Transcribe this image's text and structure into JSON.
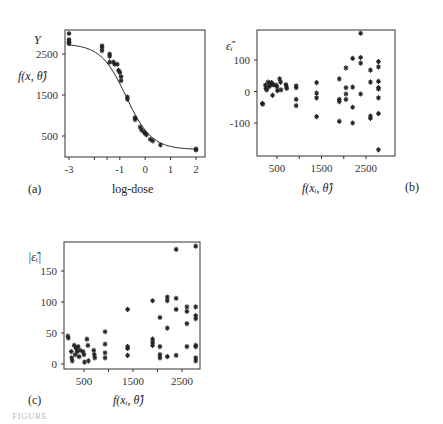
{
  "chart_data": [
    {
      "panel": "(a)",
      "type": "scatter",
      "title": "",
      "xlabel": "log-dose",
      "ylabel": "Y / f(x, θ̂)",
      "xticks": [
        -3,
        -1,
        0,
        1,
        2
      ],
      "yticks": [
        500,
        1500,
        2500
      ],
      "xlim": [
        -3.1,
        2.2
      ],
      "ylim": [
        0,
        3100
      ],
      "grid": false,
      "fitted_curve": {
        "form": "logistic",
        "top": 2750,
        "bottom": 170,
        "midpoint": -0.75,
        "slope": 2.0
      },
      "points": [
        {
          "x": -3,
          "y": 3000
        },
        {
          "x": -3,
          "y": 2850
        },
        {
          "x": -3,
          "y": 2800
        },
        {
          "x": -3,
          "y": 2780
        },
        {
          "x": -3,
          "y": 2750
        },
        {
          "x": -1.7,
          "y": 2700
        },
        {
          "x": -1.7,
          "y": 2650
        },
        {
          "x": -1.7,
          "y": 2580
        },
        {
          "x": -1.4,
          "y": 2500
        },
        {
          "x": -1.4,
          "y": 2450
        },
        {
          "x": -1.4,
          "y": 2300
        },
        {
          "x": -1.25,
          "y": 2300
        },
        {
          "x": -1.2,
          "y": 2250
        },
        {
          "x": -1.1,
          "y": 2250
        },
        {
          "x": -1.05,
          "y": 2100
        },
        {
          "x": -1.0,
          "y": 2050
        },
        {
          "x": -0.95,
          "y": 1950
        },
        {
          "x": -0.95,
          "y": 1850
        },
        {
          "x": -0.7,
          "y": 1450
        },
        {
          "x": -0.7,
          "y": 1400
        },
        {
          "x": -0.4,
          "y": 950
        },
        {
          "x": -0.4,
          "y": 900
        },
        {
          "x": -0.2,
          "y": 720
        },
        {
          "x": -0.15,
          "y": 650
        },
        {
          "x": -0.05,
          "y": 600
        },
        {
          "x": 0,
          "y": 560
        },
        {
          "x": 0.05,
          "y": 530
        },
        {
          "x": 0.2,
          "y": 420
        },
        {
          "x": 0.3,
          "y": 380
        },
        {
          "x": 0.6,
          "y": 280
        },
        {
          "x": 2,
          "y": 180
        },
        {
          "x": 2,
          "y": 160
        }
      ]
    },
    {
      "panel": "(b)",
      "type": "scatter",
      "title": "",
      "xlabel": "f(x_i, θ̂)",
      "ylabel": "ε̂_i",
      "xticks": [
        500,
        1500,
        2500
      ],
      "yticks": [
        -100,
        0,
        100
      ],
      "xlim": [
        60,
        2900
      ],
      "ylim": [
        -200,
        200
      ],
      "grid": false,
      "points": [
        {
          "x": 170,
          "y": -38
        },
        {
          "x": 180,
          "y": -40
        },
        {
          "x": 240,
          "y": 20
        },
        {
          "x": 250,
          "y": 10
        },
        {
          "x": 270,
          "y": 5
        },
        {
          "x": 300,
          "y": 30
        },
        {
          "x": 320,
          "y": 15
        },
        {
          "x": 340,
          "y": 25
        },
        {
          "x": 360,
          "y": 20
        },
        {
          "x": 380,
          "y": 28
        },
        {
          "x": 400,
          "y": -12
        },
        {
          "x": 420,
          "y": 22
        },
        {
          "x": 480,
          "y": 20
        },
        {
          "x": 500,
          "y": 15
        },
        {
          "x": 510,
          "y": 3
        },
        {
          "x": 560,
          "y": 40
        },
        {
          "x": 580,
          "y": 30
        },
        {
          "x": 590,
          "y": 5
        },
        {
          "x": 700,
          "y": 22
        },
        {
          "x": 710,
          "y": 15
        },
        {
          "x": 720,
          "y": 10
        },
        {
          "x": 930,
          "y": 18
        },
        {
          "x": 930,
          "y": 12
        },
        {
          "x": 930,
          "y": -25
        },
        {
          "x": 930,
          "y": -45
        },
        {
          "x": 1390,
          "y": 28
        },
        {
          "x": 1390,
          "y": -5
        },
        {
          "x": 1390,
          "y": -20
        },
        {
          "x": 1390,
          "y": -80
        },
        {
          "x": 1900,
          "y": 40
        },
        {
          "x": 1900,
          "y": -25
        },
        {
          "x": 1900,
          "y": -32
        },
        {
          "x": 1900,
          "y": -95
        },
        {
          "x": 2050,
          "y": 75
        },
        {
          "x": 2050,
          "y": 12
        },
        {
          "x": 2050,
          "y": -8
        },
        {
          "x": 2050,
          "y": -25
        },
        {
          "x": 2200,
          "y": 105
        },
        {
          "x": 2200,
          "y": 14
        },
        {
          "x": 2200,
          "y": -50
        },
        {
          "x": 2200,
          "y": -100
        },
        {
          "x": 2380,
          "y": 185
        },
        {
          "x": 2380,
          "y": 108
        },
        {
          "x": 2380,
          "y": 90
        },
        {
          "x": 2380,
          "y": -8
        },
        {
          "x": 2600,
          "y": 68
        },
        {
          "x": 2600,
          "y": 30
        },
        {
          "x": 2600,
          "y": -78
        },
        {
          "x": 2600,
          "y": -85
        },
        {
          "x": 2780,
          "y": 95
        },
        {
          "x": 2780,
          "y": 78
        },
        {
          "x": 2780,
          "y": 32
        },
        {
          "x": 2780,
          "y": 12
        },
        {
          "x": 2780,
          "y": 8
        },
        {
          "x": 2780,
          "y": -20
        },
        {
          "x": 2780,
          "y": -70
        },
        {
          "x": 2780,
          "y": -185
        }
      ]
    },
    {
      "panel": "(c)",
      "type": "scatter",
      "title": "",
      "xlabel": "f(x_i, θ̂)",
      "ylabel": "|ε̂_i|",
      "xticks": [
        500,
        1500,
        2500
      ],
      "yticks": [
        0,
        50,
        100,
        150
      ],
      "xlim": [
        60,
        2900
      ],
      "ylim": [
        -5,
        195
      ],
      "grid": false,
      "points": [
        {
          "x": 170,
          "y": 45
        },
        {
          "x": 180,
          "y": 42
        },
        {
          "x": 240,
          "y": 20
        },
        {
          "x": 250,
          "y": 10
        },
        {
          "x": 260,
          "y": 5
        },
        {
          "x": 300,
          "y": 30
        },
        {
          "x": 320,
          "y": 15
        },
        {
          "x": 340,
          "y": 25
        },
        {
          "x": 360,
          "y": 20
        },
        {
          "x": 380,
          "y": 28
        },
        {
          "x": 400,
          "y": 12
        },
        {
          "x": 420,
          "y": 22
        },
        {
          "x": 480,
          "y": 20
        },
        {
          "x": 500,
          "y": 15
        },
        {
          "x": 510,
          "y": 3
        },
        {
          "x": 560,
          "y": 40
        },
        {
          "x": 580,
          "y": 30
        },
        {
          "x": 590,
          "y": 5
        },
        {
          "x": 700,
          "y": 22
        },
        {
          "x": 710,
          "y": 15
        },
        {
          "x": 720,
          "y": 10
        },
        {
          "x": 930,
          "y": 52
        },
        {
          "x": 930,
          "y": 32
        },
        {
          "x": 930,
          "y": 18
        },
        {
          "x": 930,
          "y": 10
        },
        {
          "x": 1390,
          "y": 88
        },
        {
          "x": 1390,
          "y": 28
        },
        {
          "x": 1390,
          "y": 25
        },
        {
          "x": 1390,
          "y": 14
        },
        {
          "x": 1900,
          "y": 102
        },
        {
          "x": 1900,
          "y": 40
        },
        {
          "x": 1900,
          "y": 35
        },
        {
          "x": 1900,
          "y": 30
        },
        {
          "x": 2050,
          "y": 75
        },
        {
          "x": 2050,
          "y": 28
        },
        {
          "x": 2050,
          "y": 15
        },
        {
          "x": 2050,
          "y": 10
        },
        {
          "x": 2200,
          "y": 108
        },
        {
          "x": 2200,
          "y": 102
        },
        {
          "x": 2200,
          "y": 58
        },
        {
          "x": 2200,
          "y": 12
        },
        {
          "x": 2380,
          "y": 185
        },
        {
          "x": 2380,
          "y": 106
        },
        {
          "x": 2380,
          "y": 88
        },
        {
          "x": 2380,
          "y": 14
        },
        {
          "x": 2600,
          "y": 92
        },
        {
          "x": 2600,
          "y": 85
        },
        {
          "x": 2600,
          "y": 65
        },
        {
          "x": 2600,
          "y": 28
        },
        {
          "x": 2780,
          "y": 190
        },
        {
          "x": 2780,
          "y": 92
        },
        {
          "x": 2780,
          "y": 78
        },
        {
          "x": 2780,
          "y": 73
        },
        {
          "x": 2780,
          "y": 30
        },
        {
          "x": 2780,
          "y": 28
        },
        {
          "x": 2780,
          "y": 10
        },
        {
          "x": 2780,
          "y": 5
        }
      ]
    }
  ],
  "panels": {
    "a": {
      "tag": "(a)",
      "xlabel": "log-dose",
      "ylabel_top": "Y",
      "ylabel_fit": "f(x, θ̂)",
      "xticks": [
        "-3",
        "-1",
        "0",
        "1",
        "2"
      ],
      "yticks": [
        "2500",
        "1500",
        "500"
      ]
    },
    "b": {
      "tag": "(b)",
      "xlabel": "f(xᵢ, θ̂)",
      "ylabel": "ε̂ᵢ",
      "xticks": [
        "500",
        "1500",
        "2500"
      ],
      "yticks": [
        "100",
        "0",
        "-100"
      ]
    },
    "c": {
      "tag": "(c)",
      "xlabel": "f(xᵢ, θ̂)",
      "ylabel": "|ε̂ᵢ|",
      "xticks": [
        "500",
        "1500",
        "2500"
      ],
      "yticks": [
        "150",
        "100",
        "50",
        "0"
      ]
    }
  },
  "caption": "FIGURE"
}
